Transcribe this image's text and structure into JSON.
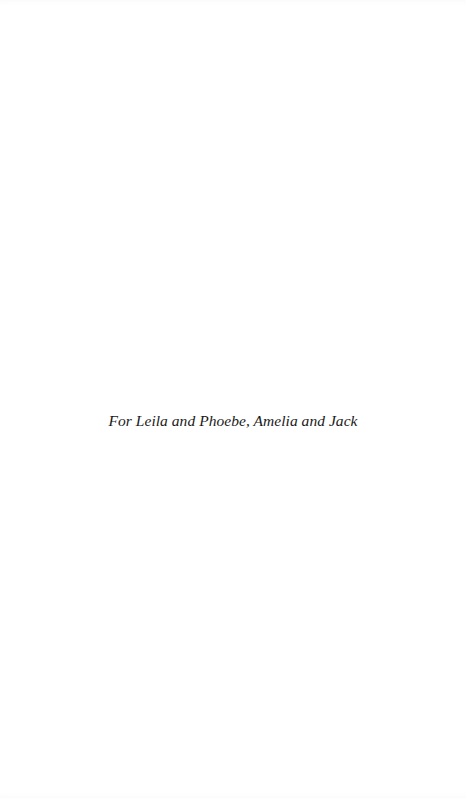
{
  "page": {
    "type": "dedication",
    "background_color": "#ffffff",
    "text_color": "#1a1a1a"
  },
  "dedication": {
    "text": "For Leila and Phoebe, Amelia and Jack"
  }
}
